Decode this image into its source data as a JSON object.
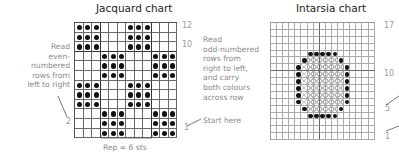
{
  "jacquard": {
    "title": "Jacquard chart",
    "left_note": "Read\neven-\nnumbered\nrows from\nleft to right",
    "right_note": "Read\nodd-numbered\nrows from\nright to left,\nand carry\nboth colours\nacross row",
    "start_note": "Start here",
    "repeat_label": "Rep = 6 sts",
    "row_labels": {
      "top": "12",
      "ten": "10",
      "two": "2",
      "one": "1"
    },
    "columns": 12,
    "rows": 12,
    "pattern": [
      "XXX...XXX...",
      "XXX...XXX...",
      "XXX...XXX...",
      "...XXX...XXX",
      "...XXX...XXX",
      "...XXX...XXX",
      "XXX...XXX...",
      "XXX...XXX...",
      "XXX...XXX...",
      "...XXX...XXX",
      "...XXX...XXX",
      "...XXX...XXX"
    ]
  },
  "intarsia": {
    "title": "Intarsia chart",
    "row_labels": {
      "top": "17",
      "ten": "10",
      "five": "5",
      "one": "1"
    },
    "columns": 17,
    "rows": 17,
    "pattern": [
      ".................",
      ".................",
      ".................",
      ".................",
      "......OOOOO......",
      ".....O#####O.....",
      "....O#######O....",
      "....O#######O....",
      "....O#######O....",
      "....O#######O....",
      "....O#######O....",
      "....O#######O....",
      ".....O#####O.....",
      "......OOOOO......",
      ".................",
      ".................",
      "................."
    ]
  },
  "colors": {
    "dot": "#111111",
    "grid": "#6a6a6a",
    "note_text": "#8a8a8a"
  }
}
